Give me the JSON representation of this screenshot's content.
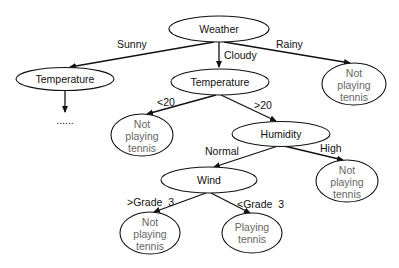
{
  "diagram": {
    "type": "decision-tree",
    "nodes": {
      "weather": {
        "label": "Weather"
      },
      "temp_left": {
        "label": "Temperature"
      },
      "temp_mid": {
        "label": "Temperature"
      },
      "rainy_leaf": {
        "lines": [
          "Not",
          "playing",
          "tennis"
        ]
      },
      "lt20_leaf": {
        "lines": [
          "Not",
          "playing",
          "tennis"
        ]
      },
      "humidity": {
        "label": "Humidity"
      },
      "high_leaf": {
        "lines": [
          "Not",
          "playing",
          "tennis"
        ]
      },
      "wind": {
        "label": "Wind"
      },
      "gt_grade_leaf": {
        "lines": [
          "Not",
          "playing",
          "tennis"
        ]
      },
      "lt_grade_leaf": {
        "lines": [
          "Playing",
          "tennis"
        ]
      },
      "continuation": {
        "label": "......"
      }
    },
    "edges": {
      "sunny": "Sunny",
      "cloudy": "Cloudy",
      "rainy": "Rainy",
      "lt20": "<20",
      "gt20": ">20",
      "normal": "Normal",
      "high": "High",
      "gt_grade": ">Grade  3",
      "lt_grade": "<Grade  3"
    }
  }
}
